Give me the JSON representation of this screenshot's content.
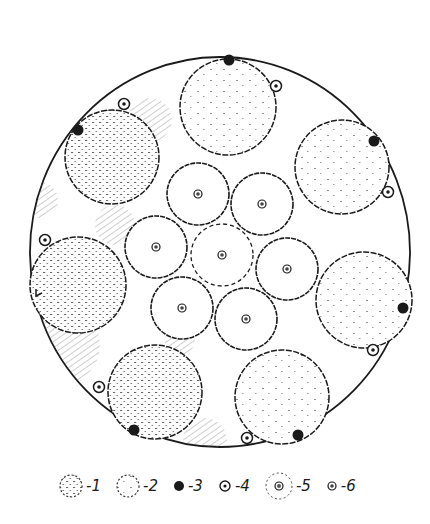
{
  "figure": {
    "type": "cross-section diagram",
    "colors": {
      "ink": "#1a1a1a",
      "stipple": "#555555",
      "background": "#ffffff"
    },
    "outer_boundary": {
      "cx": 220,
      "cy": 252,
      "rx": 190,
      "ry": 195
    },
    "large_circles": [
      {
        "id": "top",
        "cx": 228,
        "cy": 107,
        "r": 48,
        "fill_type": 2
      },
      {
        "id": "upper-left",
        "cx": 112,
        "cy": 157,
        "r": 47,
        "fill_type": 1
      },
      {
        "id": "upper-right",
        "cx": 342,
        "cy": 167,
        "r": 47,
        "fill_type": 2
      },
      {
        "id": "left",
        "cx": 78,
        "cy": 285,
        "r": 48,
        "fill_type": 1
      },
      {
        "id": "right",
        "cx": 364,
        "cy": 300,
        "r": 48,
        "fill_type": 2
      },
      {
        "id": "bottom-left",
        "cx": 155,
        "cy": 392,
        "r": 47,
        "fill_type": 1
      },
      {
        "id": "bottom-right",
        "cx": 282,
        "cy": 397,
        "r": 47,
        "fill_type": 2
      }
    ],
    "inner_circles": [
      {
        "id": "center",
        "cx": 222,
        "cy": 255,
        "r": 31,
        "dashed": true
      },
      {
        "id": "inner-1",
        "cx": 198,
        "cy": 194,
        "r": 31,
        "dashed": false
      },
      {
        "id": "inner-2",
        "cx": 262,
        "cy": 204,
        "r": 31,
        "dashed": false
      },
      {
        "id": "inner-3",
        "cx": 156,
        "cy": 247,
        "r": 31,
        "dashed": false
      },
      {
        "id": "inner-4",
        "cx": 287,
        "cy": 269,
        "r": 31,
        "dashed": false
      },
      {
        "id": "inner-5",
        "cx": 182,
        "cy": 308,
        "r": 31,
        "dashed": false
      },
      {
        "id": "inner-6",
        "cx": 246,
        "cy": 319,
        "r": 31,
        "dashed": false
      }
    ],
    "black_dots": [
      {
        "cx": 229,
        "cy": 60
      },
      {
        "cx": 78,
        "cy": 130
      },
      {
        "cx": 374,
        "cy": 141
      },
      {
        "cx": 403,
        "cy": 308
      },
      {
        "cx": 134,
        "cy": 430
      },
      {
        "cx": 298,
        "cy": 435
      }
    ],
    "small_ring_markers": [
      {
        "cx": 276,
        "cy": 86
      },
      {
        "cx": 124,
        "cy": 104
      },
      {
        "cx": 388,
        "cy": 192
      },
      {
        "cx": 45,
        "cy": 240
      },
      {
        "cx": 373,
        "cy": 350
      },
      {
        "cx": 99,
        "cy": 387
      },
      {
        "cx": 247,
        "cy": 438
      }
    ]
  },
  "legend": {
    "items": [
      {
        "symbol": "dense-stippled-circle",
        "label": "-1"
      },
      {
        "symbol": "sparse-stippled-circle",
        "label": "-2"
      },
      {
        "symbol": "black-dot",
        "label": "-3"
      },
      {
        "symbol": "small-ring-marker",
        "label": "-4"
      },
      {
        "symbol": "dashed-circle-with-core",
        "label": "-5"
      },
      {
        "symbol": "core-dot",
        "label": "-6"
      }
    ]
  }
}
